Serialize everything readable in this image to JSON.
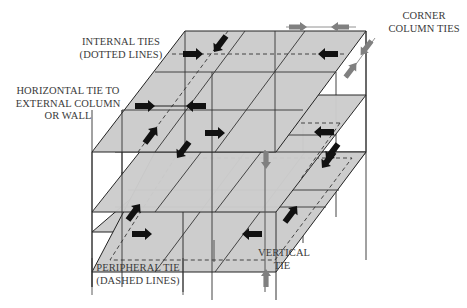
{
  "diagram": {
    "colors": {
      "slab_fill": "#cdcdcd",
      "line": "#222222",
      "column_line": "#555555",
      "dashed_line": "#333333",
      "black_arrow": "#111111",
      "grey_arrow": "#808080",
      "label_text": "#3a3a3a",
      "background": "#ffffff"
    },
    "slab_count": 3,
    "labels": {
      "internal_ties": {
        "line1": "INTERNAL TIES",
        "line2": "(DOTTED LINES)"
      },
      "horizontal_tie": {
        "line1": "HORIZONTAL TIE TO",
        "line2": "EXTERNAL COLUMN",
        "line3": "OR WALL"
      },
      "corner_column_ties": {
        "line1": "CORNER",
        "line2": "COLUMN TIES"
      },
      "peripheral_tie": {
        "line1": "PERIPHERAL TIE",
        "line2": "(DASHED LINES)"
      },
      "vertical_tie": {
        "line1": "VERTICAL",
        "line2": "TIE"
      }
    },
    "arrows": [
      {
        "id": "internal-tie-arrow-right",
        "color": "black",
        "direction": "right"
      },
      {
        "id": "internal-tie-arrow-diag-down",
        "color": "black",
        "direction": "down-left"
      },
      {
        "id": "internal-tie-arrow-left",
        "color": "black",
        "direction": "left"
      },
      {
        "id": "horizontal-tie-arrow-right",
        "color": "black",
        "direction": "right"
      },
      {
        "id": "horizontal-tie-arrow-left",
        "color": "black",
        "direction": "left"
      },
      {
        "id": "peripheral-tie-arrow-right",
        "color": "black",
        "direction": "right"
      },
      {
        "id": "peripheral-tie-arrow-left",
        "color": "black",
        "direction": "left"
      },
      {
        "id": "corner-column-tie-arrows",
        "color": "grey",
        "direction": "paired"
      },
      {
        "id": "vertical-tie-arrows",
        "color": "grey",
        "direction": "vertical"
      }
    ]
  }
}
